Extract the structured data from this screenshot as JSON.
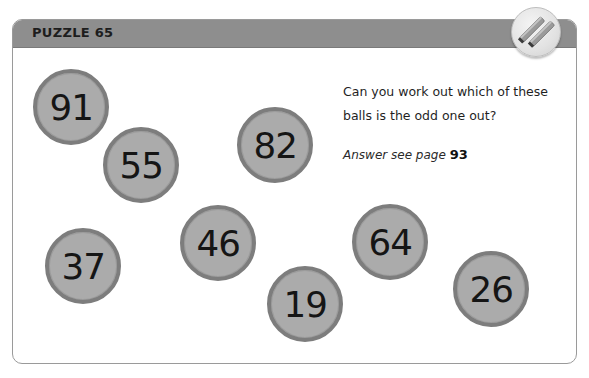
{
  "puzzle": {
    "title": "PUZZLE 65",
    "question": "Can you work out which of these balls is the odd one out?",
    "answer_prefix": "Answer see page",
    "answer_page": "93",
    "badge_icon": "pencils-icon"
  },
  "balls": [
    {
      "value": "91",
      "cx": 71,
      "cy": 107
    },
    {
      "value": "55",
      "cx": 141,
      "cy": 165
    },
    {
      "value": "82",
      "cx": 275,
      "cy": 145
    },
    {
      "value": "46",
      "cx": 218,
      "cy": 243
    },
    {
      "value": "37",
      "cx": 83,
      "cy": 266
    },
    {
      "value": "19",
      "cx": 305,
      "cy": 304
    },
    {
      "value": "64",
      "cx": 390,
      "cy": 242
    },
    {
      "value": "26",
      "cx": 491,
      "cy": 289
    }
  ],
  "colors": {
    "header_band": "#8e8e8e",
    "ball_fill": "#ababab",
    "ball_ring": "#7d7d7d",
    "text": "#1d1d1d"
  }
}
